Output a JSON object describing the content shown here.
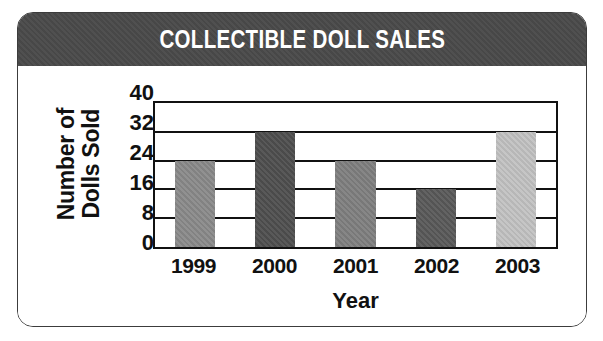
{
  "chart_data": {
    "type": "bar",
    "title": "COLLECTIBLE DOLL SALES",
    "xlabel": "Year",
    "ylabel": "Number of Dolls Sold",
    "ylabel_lines": [
      "Number of",
      "Dolls Sold"
    ],
    "categories": [
      "1999",
      "2000",
      "2001",
      "2002",
      "2003"
    ],
    "values": [
      24,
      32,
      24,
      16,
      32
    ],
    "bar_colors": [
      "#8a8a8a",
      "#4f4f4f",
      "#7f7f7f",
      "#595959",
      "#c2c2c2"
    ],
    "ylim": [
      0,
      40
    ],
    "yticks": [
      0,
      8,
      16,
      24,
      32,
      40
    ],
    "ytick_labels": [
      "0",
      "8",
      "16",
      "24",
      "32",
      "40"
    ],
    "grid": true,
    "legend": "none",
    "bars": [
      {
        "category": "1999",
        "value": 24,
        "color": "#8a8a8a"
      },
      {
        "category": "2000",
        "value": 32,
        "color": "#4f4f4f"
      },
      {
        "category": "2001",
        "value": 24,
        "color": "#7f7f7f"
      },
      {
        "category": "2002",
        "value": 16,
        "color": "#595959"
      },
      {
        "category": "2003",
        "value": 32,
        "color": "#c2c2c2"
      }
    ]
  },
  "theme": {
    "title_band_color": "#4a4a4a",
    "title_text_color": "#ffffff",
    "axis_color": "#111111",
    "card_border_color": "#3c3c3c",
    "background": "#ffffff"
  }
}
